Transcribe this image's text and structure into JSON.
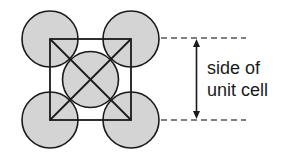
{
  "diagram": {
    "label_line1": "side of",
    "label_line2": "unit cell",
    "colors": {
      "atom_fill": "#d4d4d4",
      "stroke": "#1a1a1a",
      "dash": "#555555"
    },
    "atoms": [
      {
        "name": "corner-top-left",
        "cx": 50,
        "cy": 39,
        "r": 28
      },
      {
        "name": "corner-top-right",
        "cx": 131,
        "cy": 39,
        "r": 28
      },
      {
        "name": "corner-bottom-left",
        "cx": 50,
        "cy": 120,
        "r": 28
      },
      {
        "name": "corner-bottom-right",
        "cx": 131,
        "cy": 120,
        "r": 28
      },
      {
        "name": "center",
        "cx": 90.5,
        "cy": 79.5,
        "r": 28
      }
    ],
    "unit_cell_square": {
      "x": 50,
      "y": 39,
      "size": 81
    }
  }
}
